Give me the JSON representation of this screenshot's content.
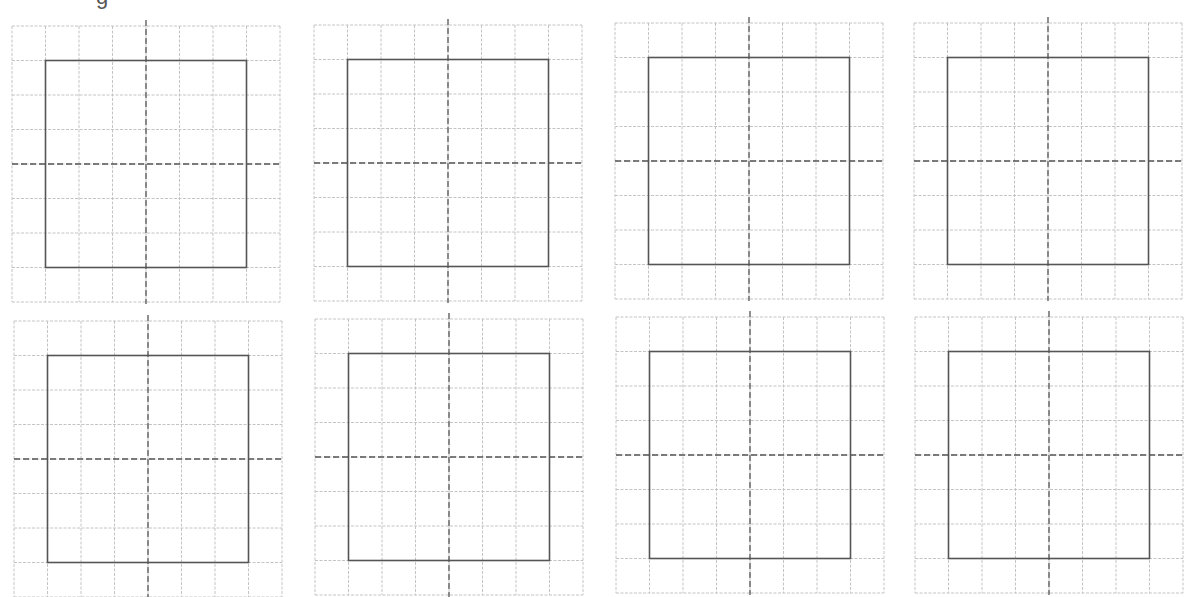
{
  "page": {
    "title_fragment": "g",
    "background": "#ffffff"
  },
  "style": {
    "grid_color": "#c4c4c4",
    "square_color": "#555555",
    "crosshair_color": "#555555"
  },
  "grid": {
    "columns": 8,
    "rows": 8,
    "cell_width": 33.5,
    "cell_height": 34.5,
    "square_start_cell": 1,
    "square_end_cell": 7,
    "crosshair_cell": 4,
    "crosshair_overhang": 6
  },
  "panels": [
    {
      "id": 1,
      "x": 12,
      "y": 26
    },
    {
      "id": 2,
      "x": 314,
      "y": 25
    },
    {
      "id": 3,
      "x": 615,
      "y": 23
    },
    {
      "id": 4,
      "x": 914,
      "y": 23
    },
    {
      "id": 5,
      "x": 14,
      "y": 321
    },
    {
      "id": 6,
      "x": 315,
      "y": 319
    },
    {
      "id": 7,
      "x": 616,
      "y": 317
    },
    {
      "id": 8,
      "x": 915,
      "y": 317
    }
  ]
}
